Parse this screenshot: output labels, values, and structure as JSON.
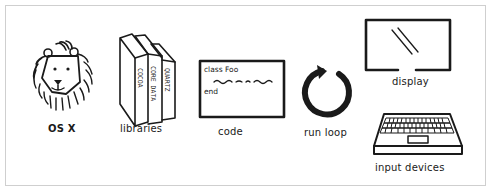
{
  "diagram": {
    "type": "illustration",
    "items": [
      {
        "id": "osx",
        "label": "OS X",
        "icon": "lion-icon"
      },
      {
        "id": "libraries",
        "label": "libraries",
        "icon": "books-icon",
        "books": [
          "COCOA",
          "CORE DATA",
          "QUARTZ"
        ]
      },
      {
        "id": "code",
        "label": "code",
        "icon": "code-window-icon",
        "code_lines": [
          "class Foo",
          "end"
        ]
      },
      {
        "id": "run_loop",
        "label": "run loop",
        "icon": "loop-arrow-icon"
      },
      {
        "id": "display",
        "label": "display",
        "icon": "monitor-icon"
      },
      {
        "id": "input_devices",
        "label": "input devices",
        "icon": "laptop-icon"
      }
    ]
  },
  "colors": {
    "ink": "#1a1a1a",
    "frame": "#cfcfcf",
    "background": "#ffffff"
  }
}
